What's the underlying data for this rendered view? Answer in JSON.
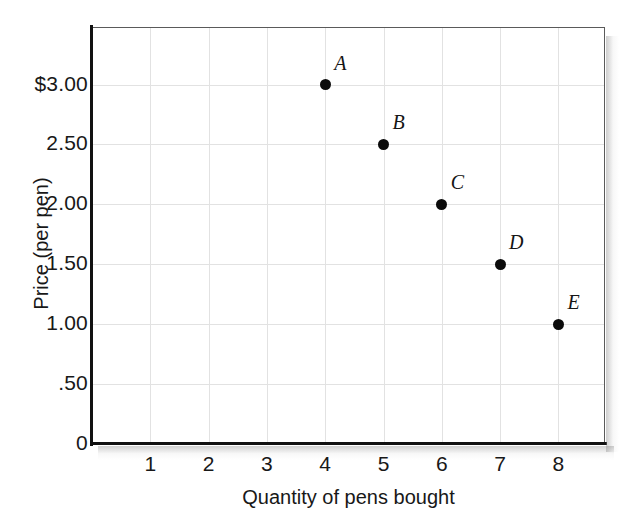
{
  "chart_data": {
    "type": "scatter",
    "title": "",
    "xlabel": "Quantity of pens bought",
    "ylabel": "Price (per pen)",
    "xlim": [
      0,
      8.8
    ],
    "ylim": [
      0,
      3.48
    ],
    "grid": true,
    "legend": "none",
    "x_ticks": [
      "1",
      "2",
      "3",
      "4",
      "5",
      "6",
      "7",
      "8"
    ],
    "x_tick_values": [
      1,
      2,
      3,
      4,
      5,
      6,
      7,
      8
    ],
    "y_ticks": [
      "0",
      ".50",
      "1.00",
      "1.50",
      "2.00",
      "2.50",
      "$3.00"
    ],
    "y_tick_values": [
      0,
      0.5,
      1.0,
      1.5,
      2.0,
      2.5,
      3.0
    ],
    "point_labels": [
      "A",
      "B",
      "C",
      "D",
      "E"
    ],
    "x": [
      4,
      5,
      6,
      7,
      8
    ],
    "y": [
      3.0,
      2.5,
      2.0,
      1.5,
      1.0
    ],
    "points": [
      {
        "label": "A",
        "x": 4,
        "y": 3.0
      },
      {
        "label": "B",
        "x": 5,
        "y": 2.5
      },
      {
        "label": "C",
        "x": 6,
        "y": 2.0
      },
      {
        "label": "D",
        "x": 7,
        "y": 1.5
      },
      {
        "label": "E",
        "x": 8,
        "y": 1.0
      }
    ],
    "marker_color": "#0b0b0b",
    "grid_color": "#e2e2e2",
    "axis_color": "#111111",
    "background_color": "#ffffff"
  }
}
